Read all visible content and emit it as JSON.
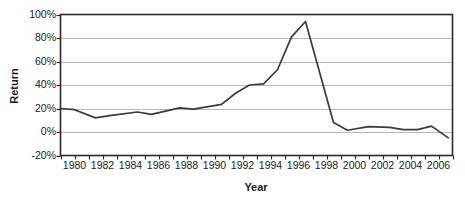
{
  "chart_data": {
    "type": "line",
    "title": "",
    "xlabel": "Year",
    "ylabel": "Return",
    "xlim": [
      1979,
      2007
    ],
    "ylim": [
      -20,
      100
    ],
    "grid": true,
    "legend": false,
    "yticks": [
      "100%",
      "80%",
      "60%",
      "40%",
      "20%",
      "0%",
      "-20%"
    ],
    "ytick_values": [
      100,
      80,
      60,
      40,
      20,
      0,
      -20
    ],
    "xticks": [
      "1980",
      "1982",
      "1984",
      "1986",
      "1988",
      "1990",
      "1992",
      "1994",
      "1996",
      "1998",
      "2000",
      "2002",
      "2004",
      "2006"
    ],
    "xtick_values": [
      1980,
      1982,
      1984,
      1986,
      1988,
      1990,
      1992,
      1994,
      1996,
      1998,
      2000,
      2002,
      2004,
      2006
    ],
    "minor_xticks": [
      1979,
      1980,
      1981,
      1982,
      1983,
      1984,
      1985,
      1986,
      1987,
      1988,
      1989,
      1990,
      1991,
      1992,
      1993,
      1994,
      1995,
      1996,
      1997,
      1998,
      1999,
      2000,
      2001,
      2002,
      2003,
      2004,
      2005,
      2006,
      2007
    ],
    "series": [
      {
        "name": "Return",
        "color": "#3a3a3a",
        "x": [
          1979.0,
          1980.0,
          1981.5,
          1982.5,
          1984.5,
          1985.5,
          1987.5,
          1988.5,
          1990.5,
          1991.5,
          1992.5,
          1993.5,
          1994.5,
          1995.5,
          1996.5,
          1998.5,
          1999.5,
          2001.0,
          2002.5,
          2003.5,
          2004.5,
          2005.5,
          2006.7
        ],
        "y": [
          20,
          19,
          12,
          14,
          17,
          15,
          20.5,
          19.5,
          23.5,
          33,
          40,
          41,
          53,
          81,
          94,
          8,
          1.5,
          4.5,
          4,
          2,
          2,
          5,
          -5
        ]
      }
    ],
    "axis_color": "#2b2b2b",
    "grid_color": "#b8b8b8",
    "background": "#ffffff"
  }
}
